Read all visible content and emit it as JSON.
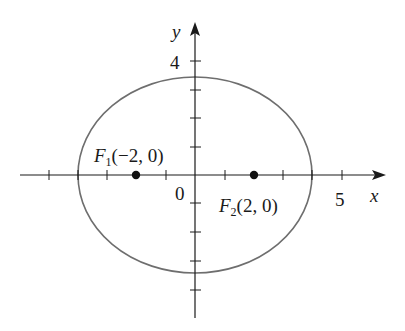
{
  "diagram": {
    "type": "ellipse-with-foci",
    "axes": {
      "x_label": "x",
      "y_label": "y",
      "origin_label": "0",
      "x_tick_label": "5",
      "y_tick_label": "4"
    },
    "ellipse": {
      "center": [
        0,
        0
      ],
      "semi_major_x": 4,
      "semi_minor_y": 3.46,
      "stroke": "#6e6e6e"
    },
    "foci": [
      {
        "name": "F",
        "sub": "1",
        "coords": "(−2, 0)",
        "x": -2,
        "y": 0
      },
      {
        "name": "F",
        "sub": "2",
        "coords": "(2, 0)",
        "x": 2,
        "y": 0
      }
    ],
    "colors": {
      "axis": "#1a1a1a",
      "ellipse": "#6e6e6e",
      "point": "#111111",
      "background": "#ffffff"
    }
  }
}
